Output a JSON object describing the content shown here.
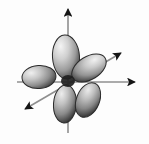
{
  "figure": {
    "kind": "orbital-diagram",
    "background_color": "#fdfdfd",
    "width": 149,
    "height": 144,
    "faint_caption": "",
    "center": {
      "x": 68,
      "y": 82
    }
  },
  "axes": {
    "stroke_color": "#8f8f8f",
    "stroke_width": 1.6,
    "arrow_color": "#1a1a1a",
    "items": [
      {
        "id": "vertical-axis",
        "label": "z",
        "x1": 68,
        "y1": 132,
        "x2": 68,
        "y2": 7,
        "arrow_at": "end",
        "arrow_x": 68,
        "arrow_y": 6,
        "arrow_angle": -90
      },
      {
        "id": "horizontal-axis",
        "label": "y",
        "x1": 17,
        "y1": 82,
        "x2": 136,
        "y2": 82,
        "arrow_at": "end",
        "arrow_x": 137,
        "arrow_y": 82,
        "arrow_angle": 0
      },
      {
        "id": "diagonal-axis",
        "label": "x",
        "x1": 23,
        "y1": 110,
        "x2": 122,
        "y2": 52,
        "arrow_at": "both",
        "arrow_x": 123,
        "arrow_y": 51,
        "arrow_angle": -30,
        "arrow2_x": 22,
        "arrow2_y": 111,
        "arrow2_angle": 150
      }
    ]
  },
  "lobes": {
    "outline_color": "#2b2b2b",
    "highlight_color": "#f2f2f2",
    "midtone_color": "#a8a8a8",
    "shadow_color": "#3a3a3a",
    "count": 5,
    "items": [
      {
        "id": "lobe-top",
        "name": "top-lobe",
        "direction": "up",
        "cx": 66,
        "cy": 57,
        "rx": 13.5,
        "ry": 22,
        "rotation": -4,
        "highlight_x": 62,
        "highlight_y": 48
      },
      {
        "id": "lobe-upper-right",
        "name": "upper-right-lobe",
        "direction": "upper-right",
        "cx": 89,
        "cy": 68,
        "rx": 11.5,
        "ry": 19,
        "rotation": 58,
        "highlight_x": 86,
        "highlight_y": 62
      },
      {
        "id": "lobe-left",
        "name": "left-lobe",
        "direction": "left",
        "cx": 39,
        "cy": 77,
        "rx": 17,
        "ry": 11.5,
        "rotation": -4,
        "highlight_x": 32,
        "highlight_y": 74
      },
      {
        "id": "lobe-lower-left",
        "name": "lower-left-lobe",
        "direction": "down",
        "cx": 65,
        "cy": 104,
        "rx": 11.5,
        "ry": 19,
        "rotation": 4,
        "highlight_x": 61,
        "highlight_y": 96
      },
      {
        "id": "lobe-lower-right",
        "name": "lower-right-lobe",
        "direction": "lower-right",
        "cx": 88,
        "cy": 100,
        "rx": 11.5,
        "ry": 18,
        "rotation": 22,
        "highlight_x": 84,
        "highlight_y": 93
      }
    ]
  }
}
